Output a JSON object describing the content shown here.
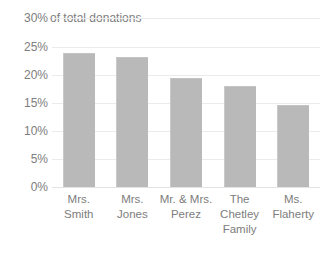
{
  "chart_data": {
    "type": "bar",
    "title": "",
    "xlabel": "",
    "ylabel": "of total donations",
    "categories": [
      "Mrs. Smith",
      "Mrs. Jones",
      "Mr. & Mrs. Perez",
      "The Chetley Family",
      "Ms. Flaherty"
    ],
    "values": [
      24.0,
      23.3,
      19.5,
      18.0,
      14.6
    ],
    "ylim": [
      0,
      30
    ],
    "ytick_labels": [
      "30%",
      "25%",
      "20%",
      "15%",
      "10%",
      "5%",
      "0%"
    ],
    "ytick_values": [
      30,
      25,
      20,
      15,
      10,
      5,
      0
    ],
    "grid": true,
    "legend": "none",
    "bar_color": "#b9b9b9",
    "gridline_color": "#ebebeb",
    "text_color": "#7d7d7d",
    "background_color": "#ffffff"
  },
  "axis": {
    "top_tick_label": "30%",
    "title": "of total donations"
  }
}
